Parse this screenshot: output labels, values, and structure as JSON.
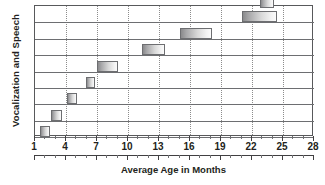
{
  "chart_data": {
    "type": "bar",
    "title": "",
    "subtitle": "",
    "xlabel": "Average Age in Months",
    "ylabel": "Vocalization and Speech",
    "xlim": [
      1,
      28
    ],
    "xticks": [
      1,
      4,
      7,
      10,
      13,
      16,
      19,
      22,
      25,
      28
    ],
    "xtick_labels": [
      "1",
      "4",
      "7",
      "10",
      "13",
      "16",
      "19",
      "22",
      "25",
      "28"
    ],
    "minor_tick_step": 1,
    "grid": {
      "vertical": true,
      "vertical_style": "dotted",
      "horizontal": true,
      "horizontal_style": "solid"
    },
    "legend": {
      "show": false,
      "position": "none"
    },
    "orientation": "horizontal",
    "bar_style": "floating-range",
    "row_count": 8,
    "series": [
      {
        "name": "Average age range",
        "ranges": [
          {
            "row": 1,
            "start": 1.5,
            "end": 2.5
          },
          {
            "row": 2,
            "start": 2.5,
            "end": 3.6
          },
          {
            "row": 3,
            "start": 4.1,
            "end": 5.1
          },
          {
            "row": 4,
            "start": 5.9,
            "end": 6.8
          },
          {
            "row": 5,
            "start": 7.0,
            "end": 9.0
          },
          {
            "row": 6,
            "start": 11.4,
            "end": 13.6
          },
          {
            "row": 7,
            "start": 15.0,
            "end": 18.1
          },
          {
            "row": 8,
            "start": 21.0,
            "end": 24.4
          },
          {
            "row": 9,
            "start": 22.8,
            "end": 24.1
          }
        ]
      }
    ],
    "colors": {
      "bar_border": "#6d6e71",
      "bar_fill_dark": "#8a8a8c",
      "bar_fill_light": "#fbfbfb",
      "frame": "#58595b",
      "gridline_vertical": "#8c8c8c",
      "gridline_horizontal": "#6d6e71",
      "text": "#231f20",
      "background": "#ffffff"
    }
  }
}
